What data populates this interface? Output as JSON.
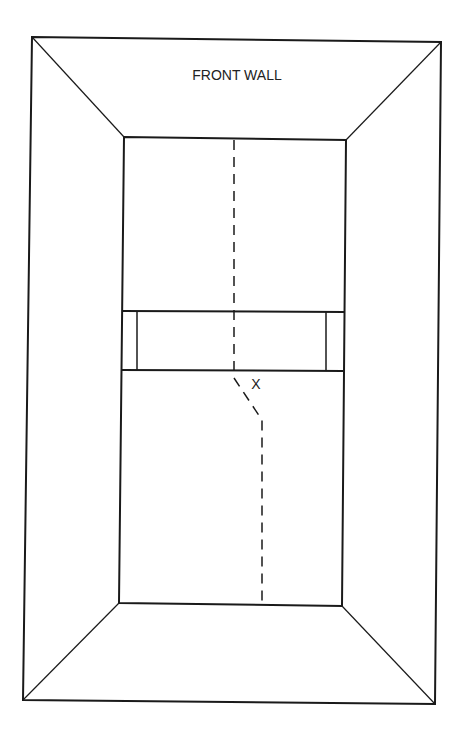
{
  "diagram": {
    "labels": {
      "front_wall": "FRONT WALL",
      "position_marker": "X"
    },
    "colors": {
      "line": "#1a1a1a",
      "background": "#ffffff"
    }
  }
}
